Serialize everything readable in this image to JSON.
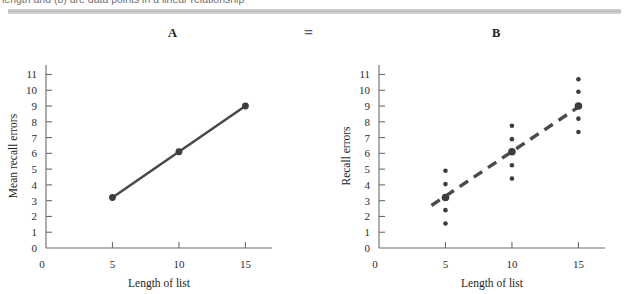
{
  "caption": {
    "cropped_text": "length and (b) are data points in a linear relationship"
  },
  "panels": {
    "a_label": "A",
    "equals": "=",
    "b_label": "B"
  },
  "chart_data": [
    {
      "id": "chart-a",
      "type": "line",
      "title": "A",
      "xlabel": "Length of list",
      "ylabel": "Mean recall errors",
      "xlim": [
        0,
        17
      ],
      "ylim": [
        0,
        11.6
      ],
      "xticks": [
        0,
        5,
        10,
        15
      ],
      "xticklabels": [
        "0",
        "5",
        "10",
        "15"
      ],
      "yticks": [
        0,
        1,
        2,
        3,
        4,
        5,
        6,
        7,
        8,
        9,
        10,
        11
      ],
      "yticklabels": [
        "0",
        "1",
        "2",
        "3",
        "4",
        "5",
        "6",
        "7",
        "8",
        "9",
        "10",
        "11"
      ],
      "grid": false,
      "legend": "none",
      "line_style": "solid",
      "x": [
        5,
        10,
        15
      ],
      "values": [
        3.2,
        6.1,
        9.0
      ],
      "marker": "filled-circle"
    },
    {
      "id": "chart-b",
      "type": "scatter",
      "title": "B",
      "xlabel": "Length of list",
      "ylabel": "Recall errors",
      "xlim": [
        0,
        17
      ],
      "ylim": [
        0,
        11.6
      ],
      "xticks": [
        0,
        5,
        10,
        15
      ],
      "xticklabels": [
        "0",
        "5",
        "10",
        "15"
      ],
      "yticks": [
        0,
        1,
        2,
        3,
        4,
        5,
        6,
        7,
        8,
        9,
        10,
        11
      ],
      "yticklabels": [
        "0",
        "1",
        "2",
        "3",
        "4",
        "5",
        "6",
        "7",
        "8",
        "9",
        "10",
        "11"
      ],
      "grid": false,
      "legend": "none",
      "line_style": "dashed",
      "trend_x": [
        5,
        15
      ],
      "trend_values": [
        3.2,
        9.0
      ],
      "series": [
        {
          "name": "group means",
          "marker": "large-filled-circle",
          "x": [
            5,
            10,
            15
          ],
          "values": [
            3.2,
            6.1,
            9.0
          ]
        },
        {
          "name": "individual observations",
          "marker": "small-filled-circle",
          "x": [
            5,
            5,
            5,
            5,
            10,
            10,
            10,
            10,
            15,
            15,
            15,
            15
          ],
          "values": [
            1.55,
            2.4,
            4.05,
            4.9,
            4.4,
            5.25,
            6.9,
            7.75,
            7.35,
            8.2,
            9.9,
            10.7
          ]
        }
      ]
    }
  ],
  "colors": {
    "ink": "#3d3d3d",
    "axis": "#6b6b6b",
    "text": "#2b2b2b",
    "rule": "#c9c9c9"
  }
}
